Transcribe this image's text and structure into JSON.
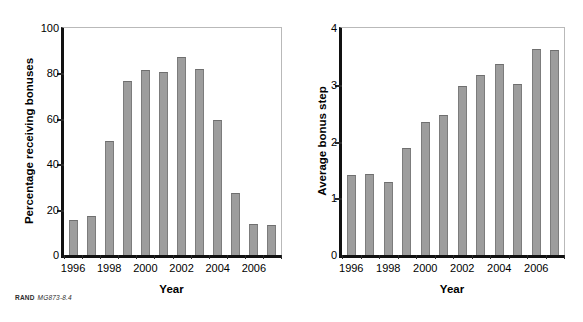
{
  "figure": {
    "credit_brand": "RAND",
    "credit_code": "MG873-8.4"
  },
  "chart_data": [
    {
      "type": "bar",
      "panel": "left",
      "title": "",
      "xlabel": "Year",
      "ylabel": "Percentage receiving bonuses",
      "ylim": [
        0,
        100
      ],
      "yticks": [
        0,
        20,
        40,
        60,
        80,
        100
      ],
      "ytick_labels": [
        "0",
        "20",
        "40",
        "60",
        "80",
        "100"
      ],
      "xtick_labels": [
        "1996",
        "1998",
        "2000",
        "2002",
        "2004",
        "2006"
      ],
      "xtick_years": [
        1996,
        1998,
        2000,
        2002,
        2004,
        2006
      ],
      "grid": false,
      "legend": "none",
      "bar_color": "#9d9d9d",
      "categories": [
        1996,
        1997,
        1998,
        1999,
        2000,
        2001,
        2002,
        2003,
        2004,
        2005,
        2006,
        2007
      ],
      "values": [
        15.5,
        17.0,
        50.3,
        76.5,
        81.5,
        80.5,
        87.2,
        82.0,
        59.4,
        27.5,
        13.6,
        13.3
      ]
    },
    {
      "type": "bar",
      "panel": "right",
      "title": "",
      "xlabel": "Year",
      "ylabel": "Average bonus step",
      "ylim": [
        0,
        4
      ],
      "yticks": [
        0,
        1,
        2,
        3,
        4
      ],
      "ytick_labels": [
        "0",
        "1",
        "2",
        "3",
        "4"
      ],
      "xtick_labels": [
        "1996",
        "1998",
        "2000",
        "2002",
        "2004",
        "2006"
      ],
      "xtick_years": [
        1996,
        1998,
        2000,
        2002,
        2004,
        2006
      ],
      "grid": false,
      "legend": "none",
      "bar_color": "#9d9d9d",
      "categories": [
        1996,
        1997,
        1998,
        1999,
        2000,
        2001,
        2002,
        2003,
        2004,
        2005,
        2006,
        2007
      ],
      "values": [
        1.41,
        1.43,
        1.29,
        1.89,
        2.35,
        2.47,
        2.98,
        3.17,
        3.36,
        3.01,
        3.63,
        3.62
      ]
    }
  ]
}
